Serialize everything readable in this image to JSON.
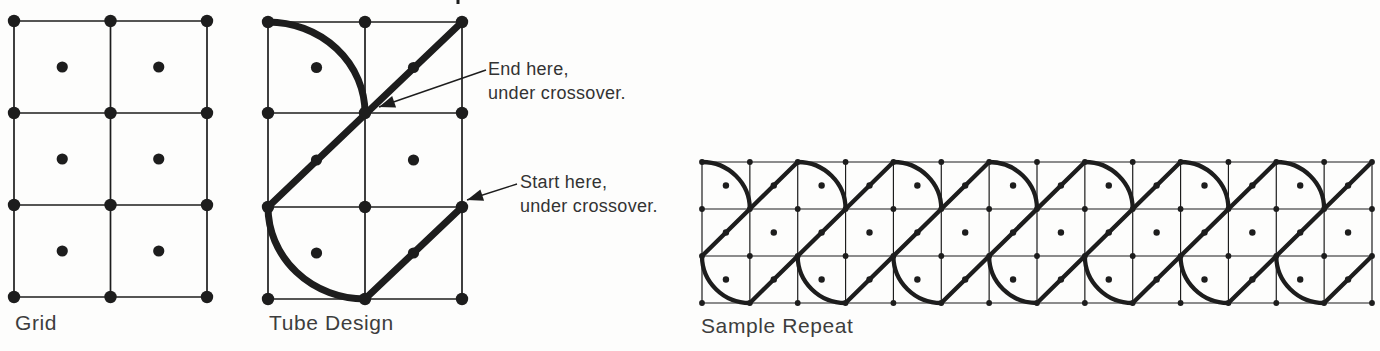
{
  "labels": {
    "grid": "Grid",
    "tube": "Tube Design",
    "sample": "Sample Repeat"
  },
  "annotations": {
    "end": {
      "line1": "End here,",
      "line2": "under crossover."
    },
    "start": {
      "line1": "Start here,",
      "line2": "under crossover."
    }
  },
  "colors": {
    "ink": "#1d1d1d",
    "label_text": "#3d3d3d",
    "background": "#fdfdfc"
  },
  "geometry": {
    "grid_figure": {
      "cols": [
        14,
        110.5,
        207
      ],
      "rows": [
        21,
        113,
        205,
        297
      ],
      "node_r": 6.2,
      "center_r": 5.6,
      "grid_w": 1.7
    },
    "tube_figure": {
      "cols": [
        268,
        365,
        462
      ],
      "rows": [
        22,
        113,
        207,
        299
      ],
      "node_r": 6.2,
      "center_r": 5.6,
      "grid_w": 1.7,
      "bold_w": 7,
      "arcs": [
        {
          "from": [
            0,
            0
          ],
          "to": [
            1,
            1
          ],
          "sweep": 1
        },
        {
          "from": [
            0,
            2
          ],
          "to": [
            1,
            3
          ],
          "sweep": 0
        }
      ],
      "lines": [
        {
          "from": [
            2,
            0
          ],
          "to": [
            0,
            2
          ]
        },
        {
          "from": [
            1,
            3
          ],
          "to": [
            2,
            2
          ]
        }
      ]
    },
    "sample_figure": {
      "x0": 702,
      "y0": 162,
      "col_step": 47.857,
      "row_step": 47,
      "n_cols": 14,
      "n_rows": 3,
      "node_r": 2.9,
      "center_r": 3.2,
      "grid_w": 1.2,
      "bold_w": 4.3,
      "top_arc_cols": [
        0,
        2,
        4,
        6,
        8,
        10,
        12
      ],
      "bottom_arc_cols": [
        0,
        2,
        4,
        6,
        8,
        10,
        12
      ],
      "diagonals": [
        {
          "from": [
            0,
            2
          ],
          "to": [
            2,
            0
          ]
        },
        {
          "from": [
            1,
            3
          ],
          "to": [
            4,
            0
          ]
        },
        {
          "from": [
            3,
            3
          ],
          "to": [
            6,
            0
          ]
        },
        {
          "from": [
            5,
            3
          ],
          "to": [
            8,
            0
          ]
        },
        {
          "from": [
            7,
            3
          ],
          "to": [
            10,
            0
          ]
        },
        {
          "from": [
            9,
            3
          ],
          "to": [
            12,
            0
          ]
        },
        {
          "from": [
            11,
            3
          ],
          "to": [
            14,
            0
          ]
        },
        {
          "from": [
            13,
            3
          ],
          "to": [
            14,
            2
          ]
        }
      ]
    },
    "arrows": [
      {
        "x1": 486,
        "y1": 70,
        "x2": 379,
        "y2": 107
      },
      {
        "x1": 517,
        "y1": 184,
        "x2": 467,
        "y2": 200
      }
    ],
    "top_tick": {
      "x": 458,
      "y1": 0,
      "y2": 4
    }
  }
}
